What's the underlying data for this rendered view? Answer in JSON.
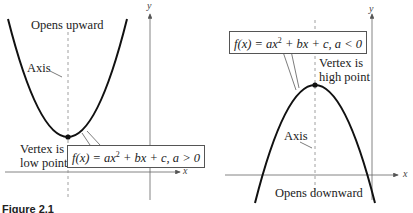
{
  "figure": {
    "caption": "Figure 2.1",
    "left_panel": {
      "title_label": "Opens upward",
      "axis_label": "Axis",
      "vertex_label_line1": "Vertex is",
      "vertex_label_line2": "low point",
      "equation_prefix": "f(x) = ax",
      "equation_exp": "2",
      "equation_suffix": " + bx + c, a > 0",
      "x_axis_label": "x",
      "y_axis_label": "y"
    },
    "right_panel": {
      "title_label": "Opens downward",
      "axis_label": "Axis",
      "vertex_label_line1": "Vertex is",
      "vertex_label_line2": "high point",
      "equation_prefix": "f(x) = ax",
      "equation_exp": "2",
      "equation_suffix": " + bx + c, a < 0",
      "x_axis_label": "x",
      "y_axis_label": "y"
    }
  },
  "colors": {
    "curve": "#111111",
    "axes": "#555555",
    "dashed_axis": "#888888"
  }
}
